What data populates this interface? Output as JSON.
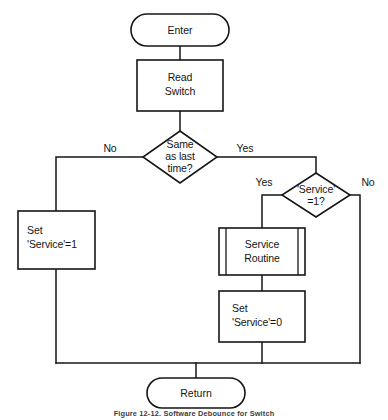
{
  "figure": {
    "caption": "Figure 12-12.  Software Debounce for Switch",
    "background_color": "#ffffff",
    "line_color": "#161616",
    "text_color": "#141414"
  },
  "nodes": {
    "enter": {
      "label": "Enter",
      "shape": "terminator"
    },
    "read_switch": {
      "line1": "Read",
      "line2": "Switch",
      "shape": "process"
    },
    "same_as_last": {
      "line1": "Same",
      "line2": "as last",
      "line3": "time?",
      "shape": "decision"
    },
    "service_eq_1": {
      "line1": "'Service'",
      "line2": "=1?",
      "shape": "decision"
    },
    "set_service_1": {
      "line1": "Set",
      "line2": "'Service'=1",
      "shape": "process"
    },
    "service_routine": {
      "line1": "Service",
      "line2": "Routine",
      "shape": "predefined-process"
    },
    "set_service_0": {
      "line1": "Set",
      "line2": "'Service'=0",
      "shape": "process"
    },
    "return": {
      "label": "Return",
      "shape": "terminator"
    }
  },
  "branch_labels": {
    "same_no": "No",
    "same_yes": "Yes",
    "service_yes": "Yes",
    "service_no": "No"
  }
}
